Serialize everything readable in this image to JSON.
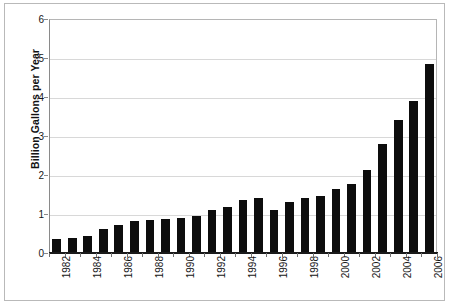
{
  "chart_data": {
    "type": "bar",
    "title": "",
    "subtitle": "",
    "xlabel": "",
    "ylabel": "Billion Gallons per Year",
    "categories": [
      "1982",
      "1983",
      "1984",
      "1985",
      "1986",
      "1987",
      "1988",
      "1989",
      "1990",
      "1991",
      "1992",
      "1993",
      "1994",
      "1995",
      "1996",
      "1997",
      "1998",
      "1999",
      "2000",
      "2001",
      "2002",
      "2003",
      "2004",
      "2005",
      "2006"
    ],
    "values": [
      0.35,
      0.38,
      0.43,
      0.61,
      0.71,
      0.83,
      0.85,
      0.87,
      0.9,
      0.95,
      1.1,
      1.17,
      1.35,
      1.4,
      1.1,
      1.3,
      1.4,
      1.47,
      1.63,
      1.77,
      2.13,
      2.8,
      3.4,
      3.9,
      4.85
    ],
    "ylim": [
      0,
      6
    ],
    "yticks": [
      0,
      1,
      2,
      3,
      4,
      5,
      6
    ],
    "ytick_labels": [
      "0",
      "1",
      "2",
      "3",
      "4",
      "5",
      "6"
    ],
    "xtick_labels": [
      "1982",
      "1984",
      "1986",
      "1988",
      "1990",
      "1992",
      "1994",
      "1996",
      "1998",
      "2000",
      "2002",
      "2004",
      "2006"
    ],
    "xtick_every": 2,
    "grid": true,
    "grid_axis": "y",
    "legend": false,
    "legend_position": "none",
    "bar_color": "#0d0d0d",
    "grid_color": "#d8d8d8",
    "axis_color": "#1a1a1a",
    "background_color": "#ffffff"
  }
}
